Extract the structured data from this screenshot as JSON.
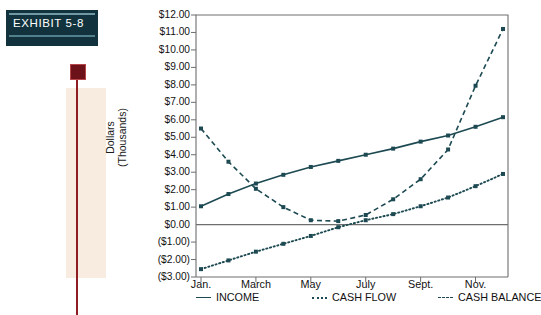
{
  "exhibit": {
    "label": "EXHIBIT  5-8"
  },
  "chart_data": {
    "type": "line",
    "title": "",
    "xlabel": "",
    "ylabel": "Dollars\n(Thousands)",
    "ylim": [
      -3,
      12
    ],
    "ytick_labels": [
      "$12.00",
      "$11.00",
      "$10.00",
      "$9.00",
      "$8.00",
      "$7.00",
      "$6.00",
      "$5.00",
      "$4.00",
      "$3.00",
      "$2.00",
      "$1.00",
      "$0.00",
      "($1.00)",
      "($2.00)",
      "($3.00)"
    ],
    "ytick_values": [
      12,
      11,
      10,
      9,
      8,
      7,
      6,
      5,
      4,
      3,
      2,
      1,
      0,
      -1,
      -2,
      -3
    ],
    "grid": false,
    "legend_position": "below",
    "x": [
      "Jan.",
      "Feb.",
      "March",
      "April",
      "May",
      "June",
      "July",
      "Aug.",
      "Sept.",
      "Oct.",
      "Nov.",
      "Dec."
    ],
    "xtick_labels": [
      "Jan.",
      "March",
      "May",
      "July",
      "Sept.",
      "Nov."
    ],
    "xtick_values": [
      "Jan.",
      "March",
      "May",
      "July",
      "Sept.",
      "Nov."
    ],
    "series": [
      {
        "name": "INCOME",
        "style": "solid",
        "color": "#1d4a52",
        "values": [
          1.05,
          1.75,
          2.35,
          2.85,
          3.3,
          3.65,
          4.0,
          4.35,
          4.75,
          5.1,
          5.6,
          6.15
        ]
      },
      {
        "name": "CASH FLOW",
        "style": "dotted",
        "color": "#1d4a52",
        "values": [
          -2.55,
          -2.05,
          -1.55,
          -1.1,
          -0.65,
          -0.15,
          0.25,
          0.6,
          1.05,
          1.55,
          2.2,
          2.9
        ]
      },
      {
        "name": "CASH BALANCE",
        "style": "dashed",
        "color": "#1d4a52",
        "values": [
          5.5,
          3.6,
          2.05,
          1.0,
          0.25,
          0.2,
          0.55,
          1.45,
          2.6,
          4.3,
          7.95,
          11.2
        ]
      }
    ]
  },
  "legend": {
    "items": [
      {
        "label": "INCOME",
        "style": "solid"
      },
      {
        "label": "CASH FLOW",
        "style": "dotted"
      },
      {
        "label": "CASH BALANCE",
        "style": "dashed"
      }
    ]
  },
  "colors": {
    "line": "#1d4a52",
    "axis": "#6e6e6e",
    "exhibit_bg": "#12333d",
    "accent_red": "#8f1c22",
    "panel_beige": "#f7ecdf"
  }
}
